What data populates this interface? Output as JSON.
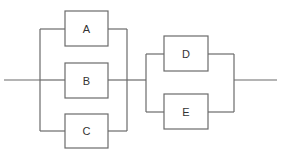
{
  "diagram": {
    "type": "reliability-block-diagram",
    "stages": [
      {
        "name": "stage-1",
        "configuration": "parallel",
        "blocks": [
          "A",
          "B",
          "C"
        ]
      },
      {
        "name": "stage-2",
        "configuration": "parallel",
        "blocks": [
          "D",
          "E"
        ]
      }
    ],
    "blocks": {
      "A": {
        "label": "A"
      },
      "B": {
        "label": "B"
      },
      "C": {
        "label": "C"
      },
      "D": {
        "label": "D"
      },
      "E": {
        "label": "E"
      }
    },
    "colors": {
      "line": "#6b6b6b",
      "text": "#333333",
      "background": "#ffffff"
    }
  }
}
